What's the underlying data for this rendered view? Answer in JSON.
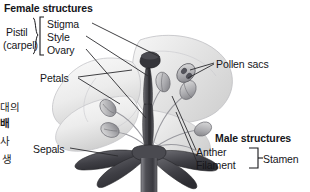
{
  "diagram": {
    "title_female": "Female structures",
    "title_male": "Male structures",
    "colors": {
      "ink": "#16161a",
      "leader": "#2b2b2f",
      "petal_light": "#f2f2f2",
      "petal_mid": "#d8d8d8",
      "pistil_dark": "#3a3a3e",
      "sepal_dark": "#4a4a4e",
      "stem": "#55555a"
    },
    "female_labels": [
      {
        "name": "stigma",
        "text": "Stigma"
      },
      {
        "name": "style",
        "text": "Style"
      },
      {
        "name": "ovary",
        "text": "Ovary"
      }
    ],
    "pistil_group": {
      "line1": "Pistil",
      "line2": "(carpel)"
    },
    "male_labels": [
      {
        "name": "anther",
        "text": "Anther"
      },
      {
        "name": "filament",
        "text": "Filament"
      }
    ],
    "stamen_group": "Stamen",
    "other_labels": [
      {
        "name": "petals",
        "text": "Petals"
      },
      {
        "name": "pollen-sacs",
        "text": "Pollen sacs"
      },
      {
        "name": "sepals",
        "text": "Sepals"
      }
    ],
    "sidebar_korean": {
      "line1": "대의",
      "line2": "배",
      "line3": "사",
      "line4": "생"
    }
  }
}
